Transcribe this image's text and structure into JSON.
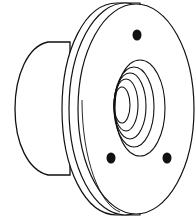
{
  "figure": {
    "colors": {
      "line": "#111111",
      "fill": "#ffffff",
      "hole": "#111111"
    },
    "parts": {
      "hub": {
        "label": "hub"
      },
      "flange": {
        "label": "flange"
      },
      "bolt_holes": [
        {
          "cx": 137,
          "cy": 35
        },
        {
          "cx": 111,
          "cy": 158
        },
        {
          "cx": 167,
          "cy": 158
        }
      ],
      "bore_rings": 5
    }
  }
}
